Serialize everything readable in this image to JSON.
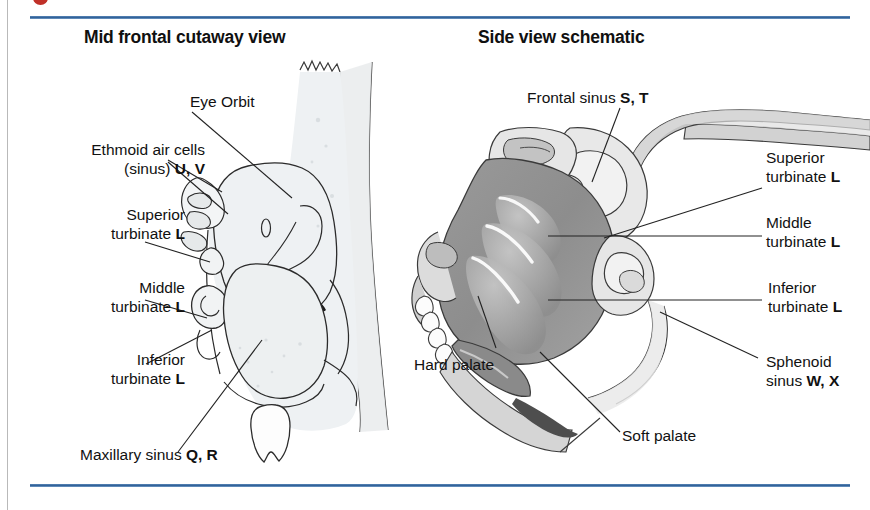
{
  "figure": {
    "type": "anatomical-diagram",
    "panels": [
      {
        "id": "left",
        "title": "Mid frontal cutaway view",
        "labels": [
          {
            "id": "eye-orbit",
            "text": "Eye Orbit",
            "bold": ""
          },
          {
            "id": "ethmoid-air-cells",
            "line1": "Ethmoid air cells",
            "line2": "(sinus) ",
            "bold": "U, V"
          },
          {
            "id": "superior-turbinate",
            "line1": "Superior",
            "line2": "turbinate ",
            "bold": "L"
          },
          {
            "id": "middle-turbinate",
            "line1": "Middle",
            "line2": "turbinate ",
            "bold": "L"
          },
          {
            "id": "inferior-turbinate",
            "line1": "Inferior",
            "line2": "turbinate ",
            "bold": "L"
          },
          {
            "id": "maxillary-sinus",
            "line1": "Maxillary sinus ",
            "bold": "Q, R"
          }
        ]
      },
      {
        "id": "right",
        "title": "Side view schematic",
        "labels": [
          {
            "id": "frontal-sinus",
            "line1": "Frontal sinus ",
            "bold": "S, T"
          },
          {
            "id": "superior-turbinate",
            "line1": "Superior",
            "line2": "turbinate ",
            "bold": "L"
          },
          {
            "id": "middle-turbinate",
            "line1": "Middle",
            "line2": "turbinate ",
            "bold": "L"
          },
          {
            "id": "inferior-turbinate",
            "line1": "Inferior",
            "line2": "turbinate ",
            "bold": "L"
          },
          {
            "id": "sphenoid-sinus",
            "line1": "Sphenoid",
            "line2": "sinus ",
            "bold": "W, X"
          },
          {
            "id": "hard-palate",
            "line1": "Hard palate",
            "bold": ""
          },
          {
            "id": "soft-palate",
            "line1": "Soft palate",
            "bold": ""
          }
        ]
      }
    ]
  },
  "left_panel": {
    "title": "Mid frontal cutaway view",
    "eye_orbit": "Eye Orbit",
    "ethmoid_l1": "Ethmoid air cells",
    "ethmoid_l2": "(sinus) ",
    "ethmoid_code": "U, V",
    "superior_l1": "Superior",
    "superior_l2": "turbinate ",
    "superior_code": "L",
    "middle_l1": "Middle",
    "middle_l2": "turbinate ",
    "middle_code": "L",
    "inferior_l1": "Inferior",
    "inferior_l2": "turbinate ",
    "inferior_code": "L",
    "maxillary_l1": "Maxillary sinus ",
    "maxillary_code": "Q, R"
  },
  "right_panel": {
    "title": "Side view schematic",
    "frontal_l1": "Frontal sinus ",
    "frontal_code": "S, T",
    "superior_l1": "Superior",
    "superior_l2": "turbinate ",
    "superior_code": "L",
    "middle_l1": "Middle",
    "middle_l2": "turbinate ",
    "middle_code": "L",
    "inferior_l1": "Inferior",
    "inferior_l2": "turbinate ",
    "inferior_code": "L",
    "sphenoid_l1": "Sphenoid",
    "sphenoid_l2": "sinus ",
    "sphenoid_code": "W, X",
    "hard_palate": "Hard palate",
    "soft_palate": "Soft palate"
  },
  "colors": {
    "rule_blue": "#2f5f96",
    "dot_red": "#c03028",
    "text": "#111111",
    "mucosa_gray": "#8f8f8f",
    "bone_light": "#dcdcdc",
    "bone_mid": "#b4b4b4",
    "outline": "#222222",
    "left_wash": "#eef1f3"
  }
}
